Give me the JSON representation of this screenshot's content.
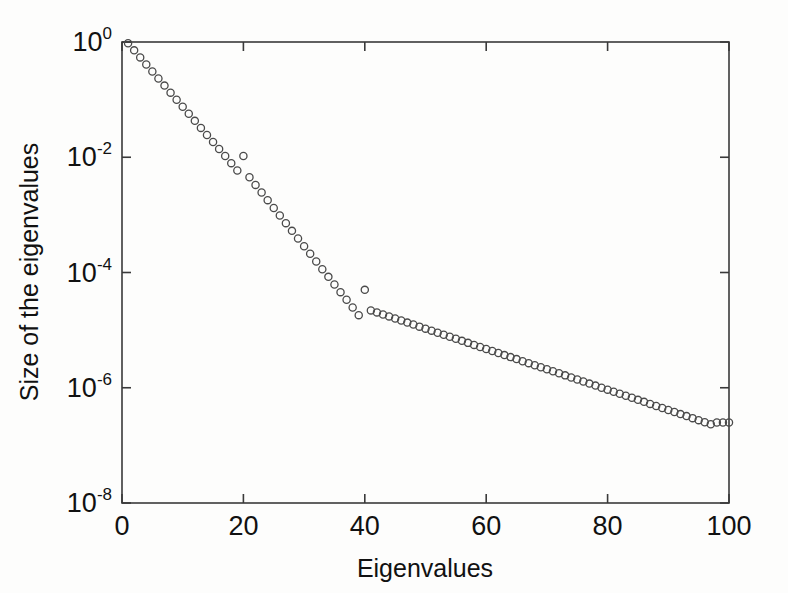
{
  "figure": {
    "background_color": "#fdfdfc",
    "axis_color": "#3a3a3a",
    "marker_color": "#4a4a4a"
  },
  "axes": {
    "x_title": "Eigenvalues",
    "y_title": "Size of the eigenvalues",
    "x_ticklabels": [
      "0",
      "20",
      "40",
      "60",
      "80",
      "100"
    ],
    "x_tickvalues": [
      0,
      20,
      40,
      60,
      80,
      100
    ],
    "y_ticklabels": [
      "10",
      "10",
      "10",
      "10",
      "10"
    ],
    "y_tickexponents": [
      "0",
      "-2",
      "-4",
      "-6",
      "-8"
    ],
    "y_tickvalues": [
      1,
      0.01,
      0.0001,
      1e-06,
      1e-08
    ]
  },
  "chart_data": {
    "type": "scatter",
    "title": "",
    "xlabel": "Eigenvalues",
    "ylabel": "Size of the eigenvalues",
    "xlim": [
      0,
      100
    ],
    "ylim": [
      1e-08,
      1
    ],
    "yscale": "log",
    "xscale": "linear",
    "grid": false,
    "legend": null,
    "marker": "open-circle",
    "segments": [
      {
        "name": "segment-1",
        "x_range": [
          1,
          20
        ],
        "y_start": 0.95,
        "y_end": 0.0105
      },
      {
        "name": "segment-2",
        "x_range": [
          21,
          40
        ],
        "y_start": 0.0045,
        "y_end": 5e-05
      },
      {
        "name": "segment-3",
        "x_range": [
          41,
          100
        ],
        "y_start": 2.2e-05,
        "y_end": 2.5e-07
      }
    ],
    "x": [
      1,
      2,
      3,
      4,
      5,
      6,
      7,
      8,
      9,
      10,
      11,
      12,
      13,
      14,
      15,
      16,
      17,
      18,
      19,
      20,
      21,
      22,
      23,
      24,
      25,
      26,
      27,
      28,
      29,
      30,
      31,
      32,
      33,
      34,
      35,
      36,
      37,
      38,
      39,
      40,
      41,
      42,
      43,
      44,
      45,
      46,
      47,
      48,
      49,
      50,
      51,
      52,
      53,
      54,
      55,
      56,
      57,
      58,
      59,
      60,
      61,
      62,
      63,
      64,
      65,
      66,
      67,
      68,
      69,
      70,
      71,
      72,
      73,
      74,
      75,
      76,
      77,
      78,
      79,
      80,
      81,
      82,
      83,
      84,
      85,
      86,
      87,
      88,
      89,
      90,
      91,
      92,
      93,
      94,
      95,
      96,
      97,
      98,
      99,
      100
    ],
    "y": [
      0.95,
      0.7167,
      0.5407,
      0.4079,
      0.3077,
      0.2322,
      0.1751,
      0.1321,
      0.0997,
      0.0752,
      0.0567,
      0.0428,
      0.0323,
      0.0244,
      0.0184,
      0.0139,
      0.0105,
      0.0079,
      0.0059,
      0.0105,
      0.0045,
      0.00331,
      0.00244,
      0.0018,
      0.00132,
      0.000975,
      0.000718,
      0.000528,
      0.000389,
      0.000286,
      0.000211,
      0.000155,
      0.000114,
      8.41e-05,
      6.19e-05,
      4.56e-05,
      3.36e-05,
      2.47e-05,
      1.82e-05,
      5e-05,
      2.2e-05,
      2.03e-05,
      1.87e-05,
      1.73e-05,
      1.59e-05,
      1.47e-05,
      1.35e-05,
      1.25e-05,
      1.15e-05,
      1.06e-05,
      9.79e-06,
      9.02e-06,
      8.32e-06,
      7.67e-06,
      7.07e-06,
      6.52e-06,
      6.01e-06,
      5.54e-06,
      5.11e-06,
      4.71e-06,
      4.34e-06,
      4e-06,
      3.69e-06,
      3.4e-06,
      3.14e-06,
      2.89e-06,
      2.67e-06,
      2.46e-06,
      2.27e-06,
      2.09e-06,
      1.93e-06,
      1.78e-06,
      1.64e-06,
      1.51e-06,
      1.39e-06,
      1.28e-06,
      1.18e-06,
      1.09e-06,
      1e-06,
      9.27e-07,
      8.54e-07,
      7.88e-07,
      7.26e-07,
      6.69e-07,
      6.17e-07,
      5.69e-07,
      5.24e-07,
      4.83e-07,
      4.46e-07,
      4.11e-07,
      3.79e-07,
      3.49e-07,
      3.22e-07,
      2.97e-07,
      2.74e-07,
      2.52e-07,
      2.33e-07,
      2.5e-07,
      2.5e-07,
      2.5e-07
    ]
  }
}
